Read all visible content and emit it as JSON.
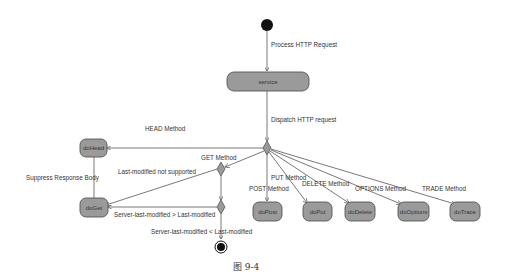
{
  "diagram": {
    "type": "uml-activity",
    "colors": {
      "node_fill": "#9a9a9a",
      "stroke": "#555555",
      "text": "#333333",
      "background": "#ffffff"
    },
    "nodes": {
      "start": {
        "kind": "initial"
      },
      "service": {
        "label": "service"
      },
      "doHead": {
        "label": "doHead"
      },
      "doGet": {
        "label": "doGet"
      },
      "doPost": {
        "label": "doPost"
      },
      "doPut": {
        "label": "doPut"
      },
      "doDelete": {
        "label": "doDelete"
      },
      "doOptions": {
        "label": "doOptions"
      },
      "doTrace": {
        "label": "doTrace"
      },
      "end": {
        "kind": "final"
      }
    },
    "edges": {
      "process": "Process HTTP Request",
      "dispatch": "Dispatch HTTP request",
      "head": "HEAD Method",
      "get": "GET Method",
      "suppress": "Suppress Response Body",
      "not_supported": "Last-modified not supported",
      "greater": "Server-last-modified > Last-modified",
      "less_equal": "Server-last-modified < Last-modified",
      "post": "POST Method",
      "put": "PUT Method",
      "delete": "DELETE Method",
      "options": "OPTIONS Method",
      "trade": "TRADE Method"
    },
    "caption": "图 9-4"
  }
}
